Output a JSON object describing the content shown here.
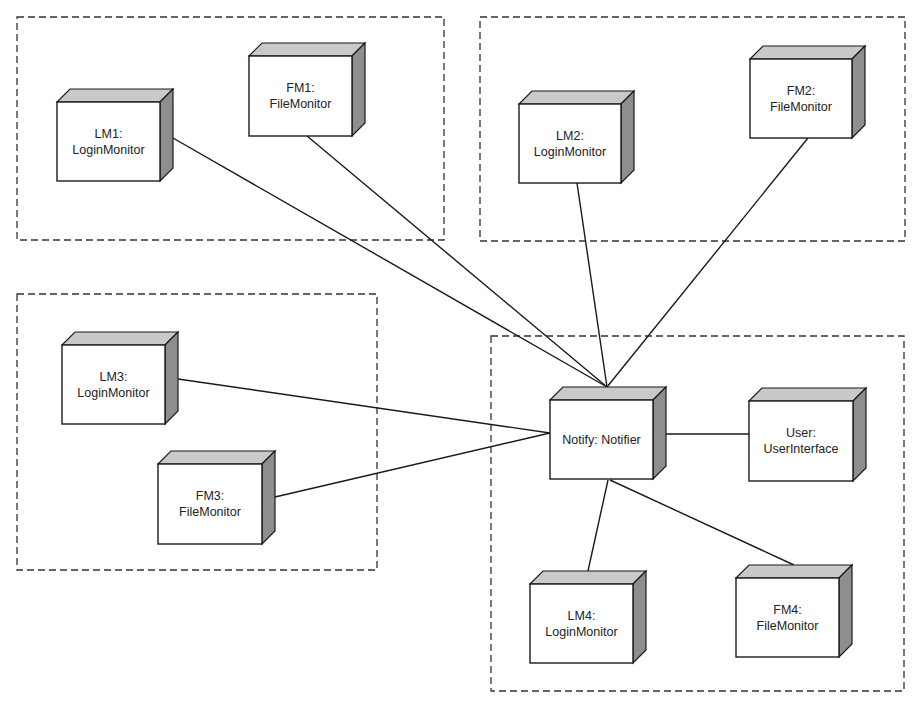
{
  "diagram": {
    "type": "UML deployment diagram",
    "colors": {
      "background": "#ffffff",
      "line": "#1a1a1a",
      "front_face": "#ffffff",
      "top_face": "#c9c9c9",
      "side_face": "#8e8e8e",
      "group_border": "#333333"
    },
    "node_depth": 13,
    "groups": [
      {
        "id": "group-1",
        "x": 17,
        "y": 17,
        "w": 427,
        "h": 223
      },
      {
        "id": "group-2",
        "x": 480,
        "y": 17,
        "w": 425,
        "h": 224
      },
      {
        "id": "group-3",
        "x": 17,
        "y": 294,
        "w": 360,
        "h": 276
      },
      {
        "id": "group-4",
        "x": 491,
        "y": 336,
        "w": 413,
        "h": 355
      }
    ],
    "nodes": [
      {
        "id": "LM1",
        "lines": [
          "LM1:",
          "LoginMonitor"
        ],
        "x": 57,
        "y": 102,
        "w": 103,
        "h": 79,
        "group": "group-1"
      },
      {
        "id": "FM1",
        "lines": [
          "FM1:",
          "FileMonitor"
        ],
        "x": 249,
        "y": 56,
        "w": 103,
        "h": 80,
        "group": "group-1"
      },
      {
        "id": "LM2",
        "lines": [
          "LM2:",
          "LoginMonitor"
        ],
        "x": 519,
        "y": 104,
        "w": 102,
        "h": 79,
        "group": "group-2"
      },
      {
        "id": "FM2",
        "lines": [
          "FM2:",
          "FileMonitor"
        ],
        "x": 750,
        "y": 59,
        "w": 102,
        "h": 79,
        "group": "group-2"
      },
      {
        "id": "LM3",
        "lines": [
          "LM3:",
          "LoginMonitor"
        ],
        "x": 62,
        "y": 345,
        "w": 103,
        "h": 79,
        "group": "group-3"
      },
      {
        "id": "FM3",
        "lines": [
          "FM3:",
          "FileMonitor"
        ],
        "x": 158,
        "y": 464,
        "w": 104,
        "h": 80,
        "group": "group-3"
      },
      {
        "id": "Notify",
        "lines": [
          "Notify: Notifier"
        ],
        "x": 550,
        "y": 400,
        "w": 103,
        "h": 79,
        "group": "group-4"
      },
      {
        "id": "User",
        "lines": [
          "User:",
          "UserInterface"
        ],
        "x": 749,
        "y": 401,
        "w": 104,
        "h": 80,
        "group": "group-4"
      },
      {
        "id": "LM4",
        "lines": [
          "LM4:",
          "LoginMonitor"
        ],
        "x": 530,
        "y": 584,
        "w": 103,
        "h": 79,
        "group": "group-4"
      },
      {
        "id": "FM4",
        "lines": [
          "FM4:",
          "FileMonitor"
        ],
        "x": 736,
        "y": 578,
        "w": 103,
        "h": 79,
        "group": "group-4"
      }
    ],
    "edges": [
      {
        "from": "LM1",
        "to": "Notify",
        "x1": 173,
        "y1": 138,
        "x2": 607,
        "y2": 387
      },
      {
        "from": "FM1",
        "to": "Notify",
        "x1": 307,
        "y1": 136,
        "x2": 607,
        "y2": 387
      },
      {
        "from": "LM2",
        "to": "Notify",
        "x1": 577,
        "y1": 183,
        "x2": 607,
        "y2": 387
      },
      {
        "from": "FM2",
        "to": "Notify",
        "x1": 808,
        "y1": 138,
        "x2": 607,
        "y2": 387
      },
      {
        "from": "LM3",
        "to": "Notify",
        "x1": 178,
        "y1": 379,
        "x2": 550,
        "y2": 433
      },
      {
        "from": "FM3",
        "to": "Notify",
        "x1": 275,
        "y1": 497,
        "x2": 550,
        "y2": 433
      },
      {
        "from": "Notify",
        "to": "User",
        "x1": 666,
        "y1": 434,
        "x2": 749,
        "y2": 434
      },
      {
        "from": "Notify",
        "to": "LM4",
        "x1": 608,
        "y1": 480,
        "x2": 588,
        "y2": 571
      },
      {
        "from": "Notify",
        "to": "FM4",
        "x1": 610,
        "y1": 480,
        "x2": 794,
        "y2": 565
      }
    ]
  }
}
